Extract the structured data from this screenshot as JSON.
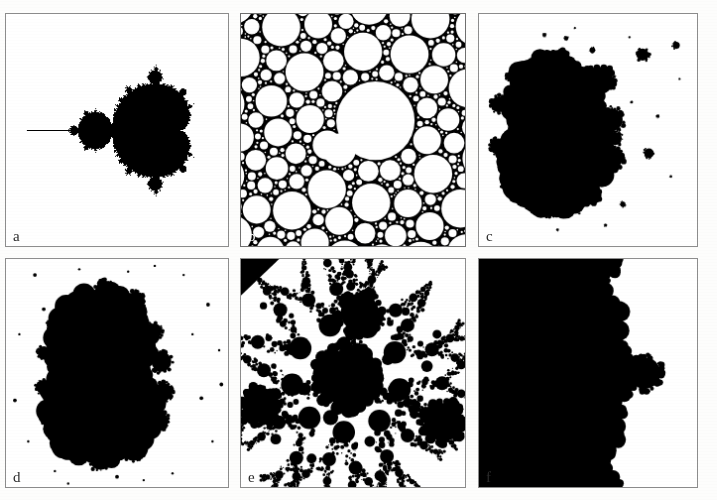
{
  "figure": {
    "background_color": "#fdfdfc",
    "ink_color": "#000000",
    "border_color": "#8d8d8d",
    "rows": 2,
    "columns": 3,
    "panels": [
      {
        "id": "panel-a",
        "label": "a",
        "kind": "mandelbrot-set",
        "inverted": false,
        "x": 5,
        "y": 13,
        "w": 224,
        "h": 234
      },
      {
        "id": "panel-b",
        "label": "b",
        "kind": "apollonian-gasket-inverted",
        "inverted": true,
        "x": 240,
        "y": 13,
        "w": 226,
        "h": 234
      },
      {
        "id": "panel-c",
        "label": "c",
        "kind": "julia-set-two-lobes-with-satellites",
        "inverted": false,
        "x": 478,
        "y": 13,
        "w": 220,
        "h": 234
      },
      {
        "id": "panel-d",
        "label": "d",
        "kind": "julia-set-double-disc",
        "inverted": false,
        "x": 5,
        "y": 258,
        "w": 224,
        "h": 230
      },
      {
        "id": "panel-e",
        "label": "e",
        "kind": "kleinian-limit-set-dendrite",
        "inverted": false,
        "x": 240,
        "y": 258,
        "w": 226,
        "h": 230
      },
      {
        "id": "panel-f",
        "label": "f",
        "kind": "julia-set-irregular-blob-with-bulb",
        "inverted": false,
        "x": 478,
        "y": 258,
        "w": 220,
        "h": 230
      }
    ]
  },
  "chart_data": {
    "type": "scatter",
    "title": "",
    "xlabel": "",
    "ylabel": "",
    "panels": [
      {
        "label": "a",
        "type": "mandelbrot",
        "description": "Classic Mandelbrot set: large cardioid right of centre, period-2 disc to its left, needle antenna extending to the left edge, decorated with period bulbs.",
        "render": "escape-time",
        "max_iterations": 60,
        "x_range": [
          -2.3,
          0.95
        ],
        "y_range": [
          -1.62,
          1.62
        ],
        "center": [
          -0.68,
          0.0
        ],
        "fill_color": "#000000",
        "background_color": "#ffffff"
      },
      {
        "label": "b",
        "type": "apollonian-inverted",
        "description": "Dense packing of white discs on black ground; one dominant large white disc right of centre, with self-similar cascades of smaller discs filling the gaps.",
        "render": "circle-packing",
        "depth": 7,
        "seed_circles": [
          {
            "cx": 0.6,
            "cy": 0.46,
            "r": 0.175
          },
          {
            "cx": 0.385,
            "cy": 0.565,
            "r": 0.065
          },
          {
            "cx": 0.135,
            "cy": 0.375,
            "r": 0.07
          },
          {
            "cx": 0.345,
            "cy": 0.045,
            "r": 0.062
          },
          {
            "cx": 0.905,
            "cy": 0.175,
            "r": 0.052
          },
          {
            "cx": 0.925,
            "cy": 0.455,
            "r": 0.05
          },
          {
            "cx": 0.16,
            "cy": 0.665,
            "r": 0.05
          },
          {
            "cx": 0.33,
            "cy": 0.985,
            "r": 0.062
          },
          {
            "cx": 0.69,
            "cy": 0.955,
            "r": 0.048
          }
        ],
        "fill_color": "#ffffff",
        "background_color": "#000000"
      },
      {
        "label": "c",
        "type": "julia",
        "description": "Filled Julia set with two large touching lobes, small decorating bulbs, and isolated satellite specks scattered to the right.",
        "render": "escape-time",
        "c": [
          -0.12,
          0.74
        ],
        "max_iterations": 50,
        "x_range": [
          -1.6,
          1.6
        ],
        "y_range": [
          -1.6,
          1.6
        ],
        "fill_color": "#000000",
        "background_color": "#ffffff"
      },
      {
        "label": "d",
        "type": "julia",
        "description": "Two large vertically stacked discs forming a figure-eight, fringed with period bulbs, plus dust specks around the frame.",
        "render": "escape-time",
        "c": [
          -0.745,
          0.113
        ],
        "max_iterations": 50,
        "x_range": [
          -1.45,
          1.45
        ],
        "y_range": [
          -1.45,
          1.45
        ],
        "fill_color": "#000000",
        "background_color": "#ffffff"
      },
      {
        "label": "e",
        "type": "kleinian-limit-set",
        "description": "Dendritic limit set: a central black disc with radiating chains of progressively smaller black discs linked by fine speckled filaments; large discs also at upper-centre, left edge and right edge.",
        "render": "limit-set",
        "branches": 9,
        "depth": 5,
        "center": [
          0.47,
          0.52
        ],
        "fill_color": "#000000",
        "background_color": "#ffffff"
      },
      {
        "label": "f",
        "type": "julia",
        "description": "Irregular ragged blob occupying the left two-thirds, with a narrow neck leading to a small four-lobed bulb on the right.",
        "render": "escape-time",
        "c": [
          -0.77,
          0.22
        ],
        "max_iterations": 50,
        "x_range": [
          -1.5,
          1.5
        ],
        "y_range": [
          -1.5,
          1.5
        ],
        "fill_color": "#000000",
        "background_color": "#ffffff"
      }
    ]
  }
}
